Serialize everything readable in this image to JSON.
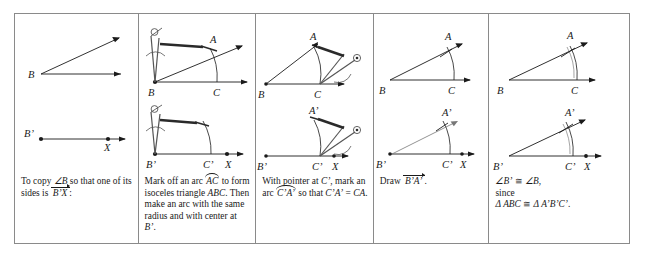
{
  "figure": {
    "stroke_color": "#1a1a1a",
    "border_color": "#8a8a8a",
    "panel_count": 5
  },
  "panels": [
    {
      "id": "panel-1",
      "caption_lines": [
        "To copy ",
        " so",
        "that one of its sides",
        "is ",
        ":"
      ],
      "caption_angle": "∠B",
      "caption_ray": "B’X",
      "labels": {
        "vertex_top": "B",
        "vertex_bottom": "B’",
        "point_x": "X"
      }
    },
    {
      "id": "panel-2",
      "caption_pre": "Mark off an arc ",
      "caption_arc": "AC",
      "caption_mid": " to form isoceles triangle ",
      "caption_triangle": "ABC",
      "caption_post": ". Then make an arc with the same radius and with center at ",
      "caption_center": "B’",
      "caption_end": ".",
      "labels": {
        "vertex_top": "B",
        "point_a": "A",
        "point_c": "C",
        "vertex_bottom": "B’",
        "point_c_prime": "C’",
        "point_x": "X"
      },
      "tool": "compass"
    },
    {
      "id": "panel-3",
      "caption_pre": "With pointer at ",
      "caption_pointer": "C’",
      "caption_mid": ", mark an arc ",
      "caption_arc": "C’A’",
      "caption_post": " so that ",
      "caption_eq_left": "C’A’",
      "caption_eq_op": " = ",
      "caption_eq_right": "CA",
      "caption_end": ".",
      "labels": {
        "vertex_top": "B",
        "point_a": "A",
        "point_c": "C",
        "vertex_bottom": "B’",
        "point_c_prime": "C’",
        "point_a_prime": "A’",
        "point_x": "X"
      },
      "tool": "compass"
    },
    {
      "id": "panel-4",
      "caption_pre": "Draw ",
      "caption_ray": "B’A’",
      "caption_end": ".",
      "labels": {
        "vertex_top": "B",
        "point_a": "A",
        "point_c": "C",
        "vertex_bottom": "B’",
        "point_c_prime": "C’",
        "point_a_prime": "A’",
        "point_x": "X"
      }
    },
    {
      "id": "panel-5",
      "caption_line1_left": "∠B’",
      "caption_line1_op": " ≅ ",
      "caption_line1_right": "∠B",
      "caption_line1_end": ",",
      "caption_line2": "since",
      "caption_line3_left": "Δ ABC",
      "caption_line3_op": " ≅ ",
      "caption_line3_right": "Δ A’B’C’",
      "caption_line3_end": ".",
      "labels": {
        "vertex_top": "B",
        "point_a": "A",
        "point_c": "C",
        "vertex_bottom": "B’",
        "point_c_prime": "C’",
        "point_a_prime": "A’",
        "point_x": "X"
      }
    }
  ]
}
